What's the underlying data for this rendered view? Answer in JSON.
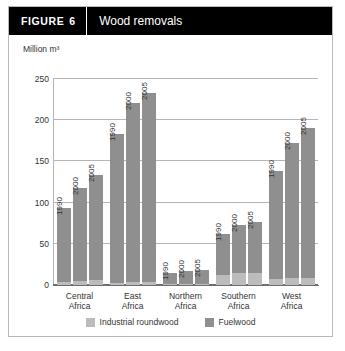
{
  "figure": {
    "tag": "FIGURE",
    "number": "6",
    "title": "Wood removals"
  },
  "colors": {
    "header_bg": "#000000",
    "header_text": "#ffffff",
    "industrial_roundwood": "#bcbcbc",
    "fuelwood": "#8f8f8f",
    "gridline": "#b5b5b5",
    "border": "#b9b9b9"
  },
  "legend": {
    "position": "bottom",
    "items": [
      {
        "label": "Industrial roundwood",
        "color": "#bcbcbc"
      },
      {
        "label": "Fuelwood",
        "color": "#8f8f8f"
      }
    ]
  },
  "chart_data": {
    "type": "bar",
    "title": "Wood removals",
    "xlabel": "",
    "ylabel": "Million m³",
    "ylim": [
      0,
      250
    ],
    "yticks": [
      0,
      50,
      100,
      150,
      200,
      250
    ],
    "ytick_labels": [
      "0",
      "50",
      "100",
      "150",
      "200",
      "250"
    ],
    "grid": true,
    "stacked": true,
    "categories": [
      "Central Africa",
      "East Africa",
      "Northern Africa",
      "Southern Africa",
      "West Africa"
    ],
    "category_lines": [
      [
        "Central",
        "Africa"
      ],
      [
        "East",
        "Africa"
      ],
      [
        "Northern",
        "Africa"
      ],
      [
        "Southern",
        "Africa"
      ],
      [
        "West",
        "Africa"
      ]
    ],
    "years": [
      "1990",
      "2000",
      "2005"
    ],
    "series": [
      {
        "name": "Industrial roundwood",
        "color": "#bcbcbc",
        "values": [
          [
            4,
            5,
            6
          ],
          [
            3,
            4,
            4
          ],
          [
            1,
            1,
            1
          ],
          [
            12,
            14,
            15
          ],
          [
            7,
            8,
            9
          ]
        ]
      },
      {
        "name": "Fuelwood",
        "color": "#8f8f8f",
        "values": [
          [
            89,
            113,
            127
          ],
          [
            180,
            217,
            229
          ],
          [
            14,
            16,
            17
          ],
          [
            50,
            59,
            61
          ],
          [
            131,
            164,
            181
          ]
        ]
      }
    ],
    "totals": [
      [
        93,
        118,
        133
      ],
      [
        183,
        221,
        233
      ],
      [
        15,
        17,
        18
      ],
      [
        62,
        73,
        76
      ],
      [
        138,
        172,
        190
      ]
    ]
  }
}
